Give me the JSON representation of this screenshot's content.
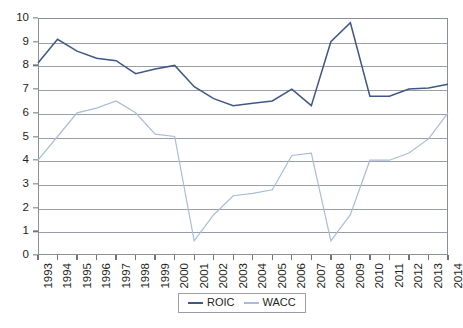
{
  "chart_data": {
    "type": "line",
    "title": "",
    "xlabel": "",
    "ylabel": "",
    "ylim": [
      0,
      10
    ],
    "ytick_step": 1,
    "grid": true,
    "legend_position": "bottom-center",
    "categories": [
      "1993",
      "1994",
      "1995",
      "1996",
      "1997",
      "1998",
      "1999",
      "2000",
      "2001",
      "2002",
      "2003",
      "2004",
      "2005",
      "2006",
      "2007",
      "2008",
      "2009",
      "2010",
      "2011",
      "2012",
      "2013",
      "2014"
    ],
    "yticks": [
      "0",
      "1",
      "2",
      "3",
      "4",
      "5",
      "6",
      "7",
      "8",
      "9",
      "10"
    ],
    "series": [
      {
        "name": "ROIC",
        "color": "#3f5787",
        "values": [
          8.1,
          9.1,
          8.6,
          8.3,
          8.2,
          7.65,
          7.85,
          8.0,
          7.1,
          6.6,
          6.3,
          6.4,
          6.5,
          7.0,
          6.3,
          9.0,
          9.8,
          6.7,
          6.7,
          7.0,
          7.05,
          7.2
        ]
      },
      {
        "name": "WACC",
        "color": "#a9bcd8",
        "values": [
          4.0,
          5.0,
          6.0,
          6.2,
          6.5,
          6.0,
          5.1,
          5.0,
          0.6,
          1.7,
          2.5,
          2.6,
          2.75,
          4.2,
          4.3,
          0.6,
          1.7,
          4.0,
          4.0,
          4.3,
          4.9,
          6.0
        ]
      }
    ]
  },
  "legend": {
    "items": [
      {
        "label": "ROIC",
        "color": "#3f5787"
      },
      {
        "label": "WACC",
        "color": "#a9bcd8"
      }
    ]
  }
}
